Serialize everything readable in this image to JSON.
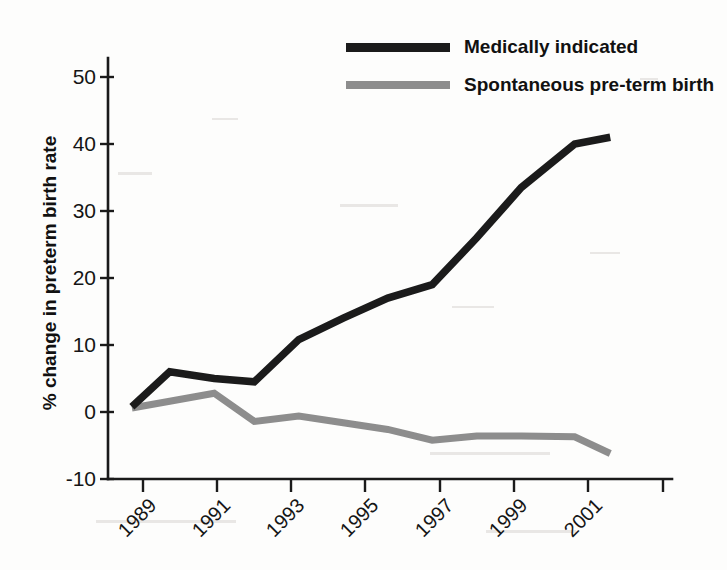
{
  "chart_data": {
    "type": "line",
    "title": "",
    "subtitle": "",
    "xlabel": "",
    "ylabel": "% change in preterm birth rate",
    "xlim": [
      1988.7,
      2001.0
    ],
    "ylim": [
      -10,
      50
    ],
    "grid": false,
    "legend_position": "top-right",
    "x_tick_labels": [
      "1989",
      "1991",
      "1993",
      "1995",
      "1997",
      "1999",
      "2001"
    ],
    "x_tick_values": [
      1989,
      1991,
      1993,
      1995,
      1997,
      1999,
      2001
    ],
    "y_tick_labels": [
      "50",
      "40",
      "30",
      "20",
      "10",
      "0",
      "-10"
    ],
    "y_tick_values": [
      50,
      40,
      30,
      20,
      10,
      0,
      -10
    ],
    "series": [
      {
        "name": "Medically indicated",
        "color": "#1b1b1b",
        "x": [
          1988.75,
          1989.6,
          1990.6,
          1991.5,
          1992.5,
          1993.5,
          1994.5,
          1995.5,
          1996.5,
          1997.5,
          1998.7,
          1999.5
        ],
        "values": [
          0.8,
          6.0,
          5.0,
          4.5,
          10.8,
          14.0,
          17.0,
          19.0,
          26.0,
          33.5,
          40.0,
          41.0
        ]
      },
      {
        "name": "Spontaneous pre-term birth",
        "color": "#8d8d8d",
        "x": [
          1988.75,
          1989.6,
          1990.6,
          1991.5,
          1992.5,
          1993.5,
          1994.5,
          1995.5,
          1996.5,
          1997.5,
          1998.7,
          1999.5
        ],
        "values": [
          0.6,
          1.6,
          2.8,
          -1.4,
          -0.6,
          -1.6,
          -2.6,
          -4.2,
          -3.6,
          -3.6,
          -3.7,
          -6.2
        ]
      }
    ]
  },
  "legend": {
    "entries": [
      {
        "label": "Medically indicated",
        "color": "#1b1b1b",
        "style": "dark"
      },
      {
        "label": "Spontaneous pre-term birth",
        "color": "#8d8d8d",
        "style": "gray"
      }
    ]
  },
  "axes": {
    "y_title": "% change in preterm birth rate"
  }
}
